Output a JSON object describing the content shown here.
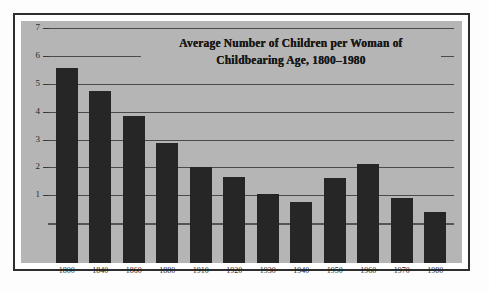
{
  "figure": {
    "name": "bar-chart-figure",
    "background_color": "#b5b5b5",
    "frame_color": "#2e2e2e",
    "bar_color": "#262626"
  },
  "chart_data": {
    "type": "bar",
    "title": "Average Number of Children per Woman of Childbearing Age, 1800–1980",
    "title_line_1": "Average Number of Children per Woman of",
    "title_line_2": "Childbearing Age, 1800–1980",
    "xlabel": "",
    "ylabel": "",
    "ylim": [
      0,
      7.4
    ],
    "grid": true,
    "legend": "none",
    "categories": [
      "1800",
      "1840",
      "1860",
      "1880",
      "1910",
      "1920",
      "1930",
      "1940",
      "1950",
      "1960",
      "1970",
      "1980"
    ],
    "values": [
      7.0,
      6.2,
      5.3,
      4.3,
      3.45,
      3.1,
      2.5,
      2.2,
      3.05,
      3.55,
      2.35,
      1.85
    ],
    "y_ticks": [
      1,
      2,
      3,
      4,
      5,
      6,
      7
    ],
    "y_tick_labels": [
      "1",
      "2",
      "3",
      "4",
      "5",
      "6",
      "7"
    ]
  }
}
